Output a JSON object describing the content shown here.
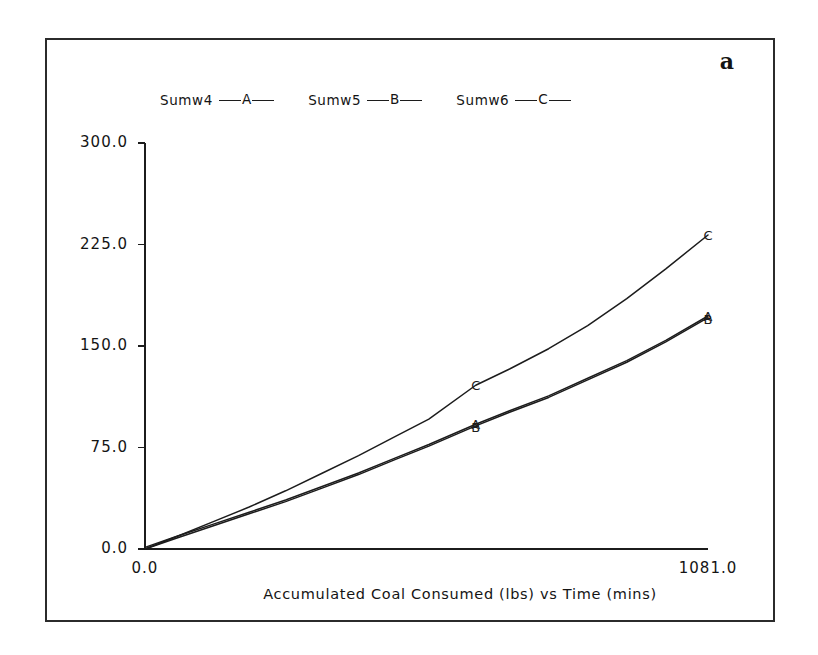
{
  "panel": {
    "letter": "a"
  },
  "legend": {
    "entries": [
      {
        "label": "Sumw4",
        "key": "A"
      },
      {
        "label": "Sumw5",
        "key": "B"
      },
      {
        "label": "Sumw6",
        "key": "C"
      }
    ]
  },
  "axes": {
    "y_ticks": [
      "300.0",
      "225.0",
      "150.0",
      "75.0",
      "0.0"
    ],
    "x_ticks": [
      "0.0",
      "1081.0"
    ]
  },
  "caption": "Accumulated Coal Consumed (lbs) vs  Time (mins)",
  "colors": {
    "line": "#1c1c1c",
    "frame": "#2b2b2b",
    "background": "#ffffff"
  },
  "chart_data": {
    "type": "line",
    "title": "Accumulated Coal Consumed (lbs) vs  Time (mins)",
    "xlabel": "Time (mins)",
    "ylabel": "Accumulated Coal Consumed (lbs)",
    "xlim": [
      0.0,
      1081.0
    ],
    "ylim": [
      0.0,
      300.0
    ],
    "yticks": [
      0.0,
      75.0,
      150.0,
      225.0,
      300.0
    ],
    "xticks": [
      0.0,
      1081.0
    ],
    "grid": false,
    "legend_position": "top",
    "marker_labels": [
      "A",
      "B",
      "C"
    ],
    "series": [
      {
        "name": "Sumw4",
        "key": "A",
        "x": [
          0,
          60,
          130,
          200,
          270,
          340,
          410,
          480,
          545,
          635,
          700,
          775,
          850,
          925,
          1000,
          1081
        ],
        "y": [
          0,
          8,
          17,
          26,
          35,
          45,
          55,
          66,
          76,
          91,
          101,
          112,
          125,
          138,
          153,
          171
        ]
      },
      {
        "name": "Sumw5",
        "key": "B",
        "x": [
          0,
          60,
          130,
          200,
          270,
          340,
          410,
          480,
          545,
          635,
          700,
          775,
          850,
          925,
          1000,
          1081
        ],
        "y": [
          0,
          8,
          17,
          26,
          35,
          45,
          55,
          66,
          76,
          91,
          101,
          112,
          125,
          138,
          153,
          171
        ]
      },
      {
        "name": "Sumw6",
        "key": "C",
        "x": [
          0,
          60,
          130,
          200,
          270,
          340,
          410,
          480,
          545,
          635,
          700,
          775,
          850,
          925,
          1000,
          1081
        ],
        "y": [
          0,
          9,
          20,
          31,
          43,
          56,
          69,
          83,
          96,
          121,
          133,
          148,
          165,
          185,
          207,
          232
        ]
      }
    ]
  }
}
